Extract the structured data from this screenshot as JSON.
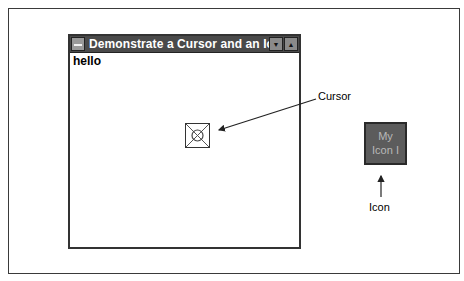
{
  "window": {
    "title": "Demonstrate a Cursor and an Icon",
    "client_text": "hello",
    "buttons": {
      "minimize": "▼",
      "maximize": "▲"
    },
    "system_menu_icon": "system-menu-icon"
  },
  "cursor": {
    "icon": "custom-cursor-icon",
    "label": "Cursor"
  },
  "minimized_icon": {
    "text_line1": "My",
    "text_line2": "Icon I",
    "label": "Icon"
  },
  "colors": {
    "title_bar": "#4a4a4a",
    "icon_fill": "#5c5c5c",
    "icon_text": "#b8b8b8"
  }
}
